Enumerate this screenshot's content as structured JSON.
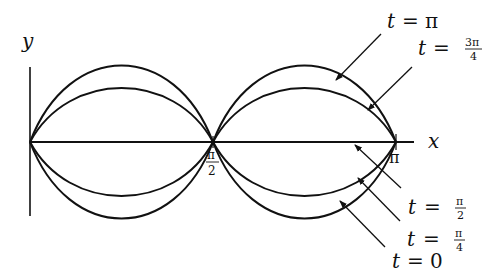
{
  "figure": {
    "background": "#ffffff",
    "stroke_color": "#111111",
    "axes": {
      "y_label": "y",
      "x_label": "x",
      "x_ticks": [
        {
          "num": "π",
          "den": "2"
        },
        {
          "num": "π",
          "den": ""
        }
      ]
    },
    "curves": [
      {
        "t": "0",
        "amplitude": 1.0,
        "side": "below"
      },
      {
        "t": "π/4",
        "amplitude": 0.707,
        "side": "below"
      },
      {
        "t": "π/2",
        "amplitude": 0.0,
        "side": "axis"
      },
      {
        "t": "3π/4",
        "amplitude": 0.707,
        "side": "above"
      },
      {
        "t": "π",
        "amplitude": 1.0,
        "side": "above"
      }
    ],
    "labels": {
      "t_pi": {
        "var": "t",
        "eq": "=",
        "val": "π"
      },
      "t_3pi4": {
        "var": "t",
        "eq": "=",
        "num": "3π",
        "den": "4"
      },
      "t_pi2": {
        "var": "t",
        "eq": "=",
        "num": "π",
        "den": "2"
      },
      "t_pi4": {
        "var": "t",
        "eq": "=",
        "num": "π",
        "den": "4"
      },
      "t_0": {
        "var": "t",
        "eq": "=",
        "val": "0"
      }
    }
  }
}
